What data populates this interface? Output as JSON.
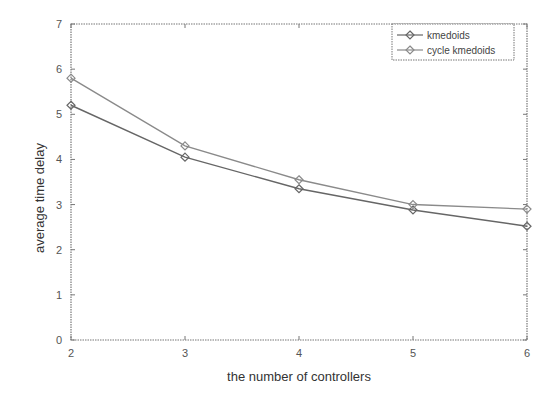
{
  "chart_data": {
    "type": "line",
    "title": "",
    "xlabel": "the number of controllers",
    "ylabel": "average time delay",
    "x": [
      2,
      3,
      4,
      5,
      6
    ],
    "xlim": [
      2,
      6
    ],
    "ylim": [
      0,
      7
    ],
    "xticks": [
      "2",
      "3",
      "4",
      "5",
      "6"
    ],
    "yticks": [
      "0",
      "1",
      "2",
      "3",
      "4",
      "5",
      "6",
      "7"
    ],
    "grid": false,
    "legend_position": "upper right",
    "series": [
      {
        "name": "kmedoids",
        "values": [
          5.2,
          4.05,
          3.35,
          2.88,
          2.52
        ],
        "color": "#666666",
        "marker": "diamond"
      },
      {
        "name": "cycle kmedoids",
        "values": [
          5.8,
          4.3,
          3.55,
          3.0,
          2.9
        ],
        "color": "#8a8a8a",
        "marker": "diamond"
      }
    ]
  }
}
